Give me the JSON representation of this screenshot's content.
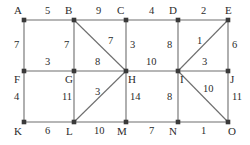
{
  "figure": {
    "style": {
      "edge_color": "#6e6e6e",
      "node_color": "#3a3a3a",
      "label_color": "#2b2b2b",
      "background": "#ffffff"
    }
  },
  "graph_data": {
    "type": "graph",
    "directed": false,
    "weighted": true,
    "nodes": [
      {
        "id": "A",
        "label": "A",
        "x": 24,
        "y": 20,
        "label_x": 14,
        "label_y": 5
      },
      {
        "id": "B",
        "label": "B",
        "x": 74,
        "y": 20,
        "label_x": 65,
        "label_y": 5
      },
      {
        "id": "C",
        "label": "C",
        "x": 126,
        "y": 20,
        "label_x": 117,
        "label_y": 5
      },
      {
        "id": "D",
        "label": "D",
        "x": 178,
        "y": 20,
        "label_x": 169,
        "label_y": 5
      },
      {
        "id": "E",
        "label": "E",
        "x": 228,
        "y": 20,
        "label_x": 225,
        "label_y": 5
      },
      {
        "id": "F",
        "label": "F",
        "x": 24,
        "y": 71,
        "label_x": 14,
        "label_y": 74
      },
      {
        "id": "G",
        "label": "G",
        "x": 74,
        "y": 71,
        "label_x": 65,
        "label_y": 74
      },
      {
        "id": "H",
        "label": "H",
        "x": 126,
        "y": 71,
        "label_x": 128,
        "label_y": 74
      },
      {
        "id": "I",
        "label": "I",
        "x": 178,
        "y": 71,
        "label_x": 180,
        "label_y": 74
      },
      {
        "id": "J",
        "label": "J",
        "x": 228,
        "y": 71,
        "label_x": 230,
        "label_y": 74
      },
      {
        "id": "K",
        "label": "K",
        "x": 24,
        "y": 122,
        "label_x": 14,
        "label_y": 126
      },
      {
        "id": "L",
        "label": "L",
        "x": 74,
        "y": 122,
        "label_x": 66,
        "label_y": 126
      },
      {
        "id": "M",
        "label": "M",
        "x": 126,
        "y": 122,
        "label_x": 117,
        "label_y": 126
      },
      {
        "id": "N",
        "label": "N",
        "x": 178,
        "y": 122,
        "label_x": 169,
        "label_y": 126
      },
      {
        "id": "O",
        "label": "O",
        "x": 228,
        "y": 122,
        "label_x": 228,
        "label_y": 126
      }
    ],
    "edges": [
      {
        "id": "A-B",
        "source": "A",
        "target": "B",
        "weight": "5",
        "label_x": 45,
        "label_y": 6
      },
      {
        "id": "B-C",
        "source": "B",
        "target": "C",
        "weight": "9",
        "label_x": 96,
        "label_y": 6
      },
      {
        "id": "C-D",
        "source": "C",
        "target": "D",
        "weight": "4",
        "label_x": 149,
        "label_y": 6
      },
      {
        "id": "D-E",
        "source": "D",
        "target": "E",
        "weight": "2",
        "label_x": 201,
        "label_y": 6
      },
      {
        "id": "F-G",
        "source": "F",
        "target": "G",
        "weight": "3",
        "label_x": 45,
        "label_y": 57
      },
      {
        "id": "G-H",
        "source": "G",
        "target": "H",
        "weight": "8",
        "label_x": 95,
        "label_y": 57
      },
      {
        "id": "H-I",
        "source": "H",
        "target": "I",
        "weight": "10",
        "label_x": 146,
        "label_y": 57
      },
      {
        "id": "I-J",
        "source": "I",
        "target": "J",
        "weight": "3",
        "label_x": 202,
        "label_y": 57
      },
      {
        "id": "K-L",
        "source": "K",
        "target": "L",
        "weight": "6",
        "label_x": 45,
        "label_y": 126
      },
      {
        "id": "L-M",
        "source": "L",
        "target": "M",
        "weight": "10",
        "label_x": 94,
        "label_y": 126
      },
      {
        "id": "M-N",
        "source": "M",
        "target": "N",
        "weight": "7",
        "label_x": 149,
        "label_y": 126
      },
      {
        "id": "N-O",
        "source": "N",
        "target": "O",
        "weight": "1",
        "label_x": 201,
        "label_y": 126
      },
      {
        "id": "A-F",
        "source": "A",
        "target": "F",
        "weight": "7",
        "label_x": 14,
        "label_y": 40
      },
      {
        "id": "B-G",
        "source": "B",
        "target": "G",
        "weight": "7",
        "label_x": 64,
        "label_y": 40
      },
      {
        "id": "C-H",
        "source": "C",
        "target": "H",
        "weight": "3",
        "label_x": 130,
        "label_y": 40
      },
      {
        "id": "D-I",
        "source": "D",
        "target": "I",
        "weight": "8",
        "label_x": 167,
        "label_y": 40
      },
      {
        "id": "E-J",
        "source": "E",
        "target": "J",
        "weight": "6",
        "label_x": 232,
        "label_y": 40
      },
      {
        "id": "F-K",
        "source": "F",
        "target": "K",
        "weight": "4",
        "label_x": 14,
        "label_y": 92
      },
      {
        "id": "G-L",
        "source": "G",
        "target": "L",
        "weight": "11",
        "label_x": 62,
        "label_y": 92
      },
      {
        "id": "H-M",
        "source": "H",
        "target": "M",
        "weight": "14",
        "label_x": 130,
        "label_y": 92
      },
      {
        "id": "I-N",
        "source": "I",
        "target": "N",
        "weight": "8",
        "label_x": 167,
        "label_y": 92
      },
      {
        "id": "J-O",
        "source": "J",
        "target": "O",
        "weight": "11",
        "label_x": 232,
        "label_y": 92
      },
      {
        "id": "B-H",
        "source": "B",
        "target": "H",
        "weight": "7",
        "label_x": 108,
        "label_y": 36
      },
      {
        "id": "L-H",
        "source": "L",
        "target": "H",
        "weight": "3",
        "label_x": 95,
        "label_y": 87
      },
      {
        "id": "I-E",
        "source": "I",
        "target": "E",
        "weight": "1",
        "label_x": 197,
        "label_y": 36
      },
      {
        "id": "I-O",
        "source": "I",
        "target": "O",
        "weight": "10",
        "label_x": 203,
        "label_y": 84
      }
    ]
  }
}
